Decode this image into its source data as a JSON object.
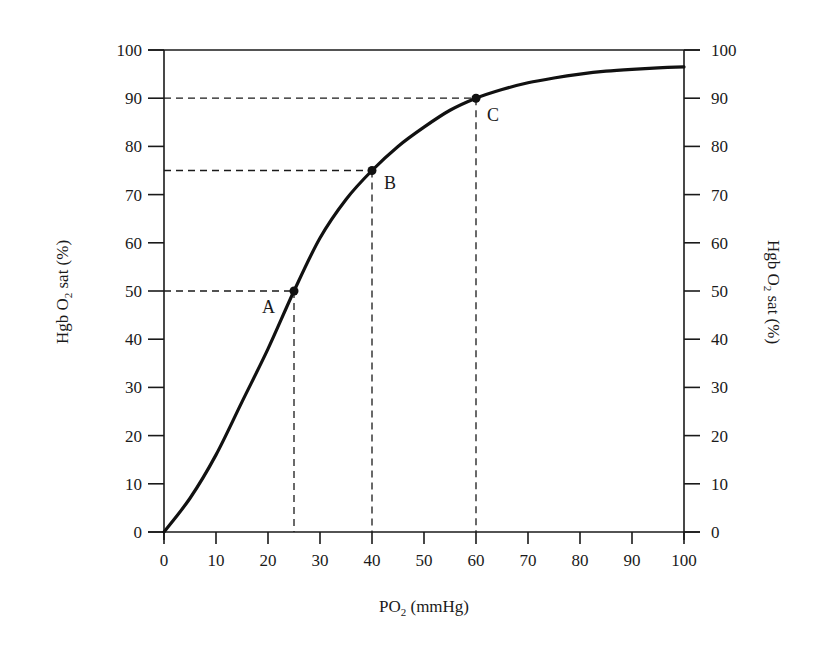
{
  "chart_data": {
    "type": "line",
    "title": "",
    "xlabel": "PO₂ (mmHg)",
    "ylabel": "Hgb O₂ sat (%)",
    "ylabel_right": "Hgb O₂ sat (%)",
    "xlim": [
      0,
      100
    ],
    "ylim": [
      0,
      100
    ],
    "grid": false,
    "legend": null,
    "x_ticks": [
      0,
      10,
      20,
      30,
      40,
      50,
      60,
      70,
      80,
      90,
      100
    ],
    "y_ticks": [
      0,
      10,
      20,
      30,
      40,
      50,
      60,
      70,
      80,
      90,
      100
    ],
    "series": [
      {
        "name": "Oxyhemoglobin dissociation curve",
        "x": [
          0,
          5,
          10,
          15,
          20,
          25,
          30,
          35,
          40,
          45,
          50,
          55,
          60,
          65,
          70,
          75,
          80,
          85,
          90,
          95,
          100
        ],
        "values": [
          0,
          7,
          16,
          27,
          38,
          50,
          61,
          69,
          75,
          80,
          84,
          87.5,
          90,
          91.8,
          93.2,
          94.2,
          95,
          95.6,
          96,
          96.3,
          96.5
        ]
      }
    ],
    "annotations": [
      {
        "label": "A",
        "x": 25,
        "y": 50,
        "guides": "dashed"
      },
      {
        "label": "B",
        "x": 40,
        "y": 75,
        "guides": "dashed"
      },
      {
        "label": "C",
        "x": 60,
        "y": 90,
        "guides": "dashed"
      }
    ]
  },
  "labels": {
    "xlabel_main": "PO",
    "xlabel_sub": "2",
    "xlabel_rest": " (mmHg)",
    "ylabel_main": "Hgb O",
    "ylabel_sub": "2",
    "ylabel_rest": " sat (%)",
    "point_a": "A",
    "point_b": "B",
    "point_c": "C"
  },
  "ticks": {
    "x": [
      "0",
      "10",
      "20",
      "30",
      "40",
      "50",
      "60",
      "70",
      "80",
      "90",
      "100"
    ],
    "y": [
      "0",
      "10",
      "20",
      "30",
      "40",
      "50",
      "60",
      "70",
      "80",
      "90",
      "100"
    ]
  }
}
